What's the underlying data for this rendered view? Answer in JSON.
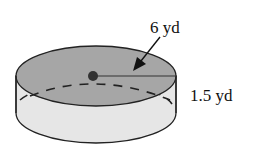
{
  "figure": {
    "shape": "cylinder",
    "radius_label": "6 yd",
    "height_label": "1.5 yd"
  },
  "colors": {
    "top_fill": "#a6a6a6",
    "side_fill": "#e6e6e6",
    "stroke": "#222222",
    "background": "#ffffff"
  }
}
